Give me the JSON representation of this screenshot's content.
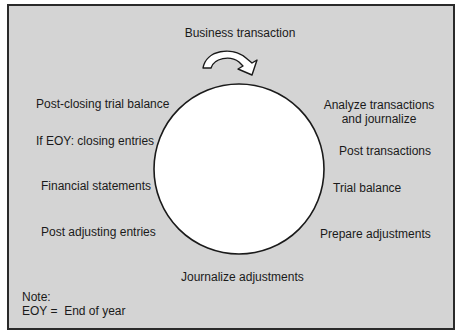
{
  "diagram": {
    "type": "accounting-cycle",
    "start": "Business transaction",
    "steps": [
      "Analyze transactions and journalize",
      "Post transactions",
      "Trial balance",
      "Prepare adjustments",
      "Journalize adjustments",
      "Post adjusting entries",
      "Financial statements",
      "If EOY: closing entries",
      "Post-closing trial balance"
    ],
    "labels": {
      "business_transaction": "Business transaction",
      "analyze_line1": "Analyze transactions",
      "analyze_line2": "and journalize",
      "post_transactions": "Post transactions",
      "trial_balance": "Trial balance",
      "prepare_adjustments": "Prepare adjustments",
      "journalize_adjustments": "Journalize adjustments",
      "post_adjusting_entries": "Post adjusting entries",
      "financial_statements": "Financial statements",
      "closing_entries": "If EOY: closing entries",
      "post_closing_trial_balance": "Post-closing trial balance"
    },
    "note": {
      "title": "Note:",
      "text": "EOY =  End of year"
    },
    "colors": {
      "background": "#d4d4d4",
      "circle_fill": "#ffffff",
      "stroke": "#1a1a1a"
    }
  }
}
